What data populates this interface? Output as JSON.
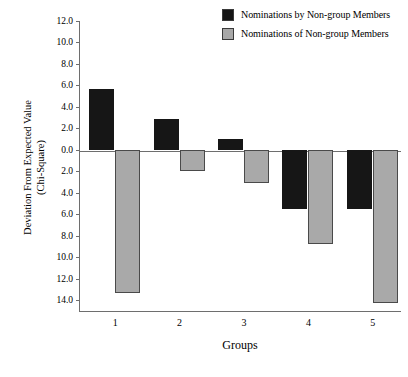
{
  "chart_data": {
    "type": "bar",
    "title": "",
    "xlabel": "Groups",
    "ylabel": "Deviation From Expected Value (Chi-Square)",
    "ylabel_lines": [
      "Deviation From Expected Value",
      "(Chi-Square)"
    ],
    "categories": [
      "1",
      "2",
      "3",
      "4",
      "5"
    ],
    "series": [
      {
        "name": "Nominations by Non-group Members",
        "color": "#161616",
        "values": [
          5.7,
          2.9,
          1.0,
          -5.5,
          -5.5
        ]
      },
      {
        "name": "Nominations of Non-group Members",
        "color": "#a9a9a9",
        "values": [
          -13.3,
          -2.0,
          -3.1,
          -8.8,
          -14.3
        ]
      }
    ],
    "ylim": [
      -15.0,
      12.0
    ],
    "ytick_values": [
      12.0,
      10.0,
      8.0,
      6.0,
      4.0,
      2.0,
      0.0,
      -2.0,
      -4.0,
      -6.0,
      -8.0,
      -10.0,
      -12.0,
      -14.0
    ],
    "ytick_labels": [
      "12.0",
      "10.0",
      "8.0",
      "6.0",
      "4.0",
      "2.0",
      "0.0",
      "2.0",
      "4.0",
      "6.0",
      "8.0",
      "10.0",
      "12.0",
      "14.0"
    ],
    "grid": false,
    "legend_position": "top-right",
    "zero_line": true
  },
  "legend": {
    "items": [
      {
        "label": "Nominations by Non-group Members",
        "swatch": "black"
      },
      {
        "label": "Nominations of Non-group Members",
        "swatch": "gray"
      }
    ]
  },
  "axes": {
    "y_title_line1": "Deviation From Expected Value",
    "y_title_line2": "(Chi-Square)",
    "x_title": "Groups"
  }
}
